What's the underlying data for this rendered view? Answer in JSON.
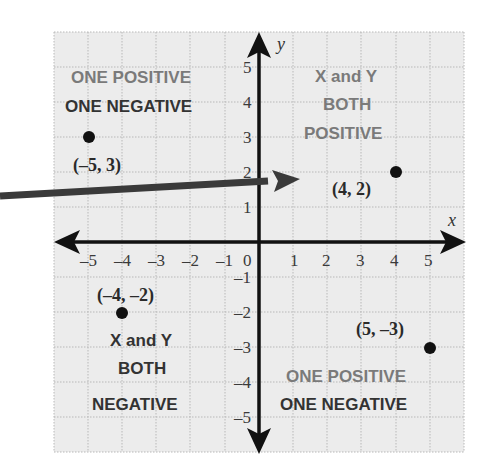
{
  "diagram": {
    "axes": {
      "x_label": "x",
      "y_label": "y",
      "x_ticks": [
        "–5",
        "–4",
        "–3",
        "–2",
        "–1",
        "0",
        "1",
        "2",
        "3",
        "4",
        "5"
      ],
      "y_ticks_positive": [
        "5",
        "4",
        "3",
        "2",
        "1"
      ],
      "y_ticks_negative": [
        "–1",
        "–2",
        "–3",
        "–4",
        "–5"
      ],
      "range": {
        "x": [
          -6,
          6
        ],
        "y": [
          -6,
          6
        ]
      }
    },
    "points": [
      {
        "x": -5,
        "y": 3,
        "label": "(–5, 3)"
      },
      {
        "x": 4,
        "y": 2,
        "label": "(4, 2)"
      },
      {
        "x": -4,
        "y": -2,
        "label": "(–4, –2)"
      },
      {
        "x": 5,
        "y": -3,
        "label": "(5, –3)"
      }
    ],
    "quadrant_labels": {
      "q2": {
        "line1": "ONE POSITIVE",
        "line2": "ONE NEGATIVE"
      },
      "q1": {
        "line1": "X and Y",
        "line2": "BOTH",
        "line3": "POSITIVE"
      },
      "q3": {
        "line1": "X and Y",
        "line2": "BOTH",
        "line3": "NEGATIVE"
      },
      "q4": {
        "line1": "ONE POSITIVE",
        "line2": "ONE NEGATIVE"
      }
    },
    "colors": {
      "grid_bg": "#ececec",
      "grid_line": "#b5b5b5",
      "axis": "#111111",
      "pointer_arrow": "#3a3a3a",
      "label_light": "#7a7a7a",
      "label_dark": "#333333"
    }
  }
}
